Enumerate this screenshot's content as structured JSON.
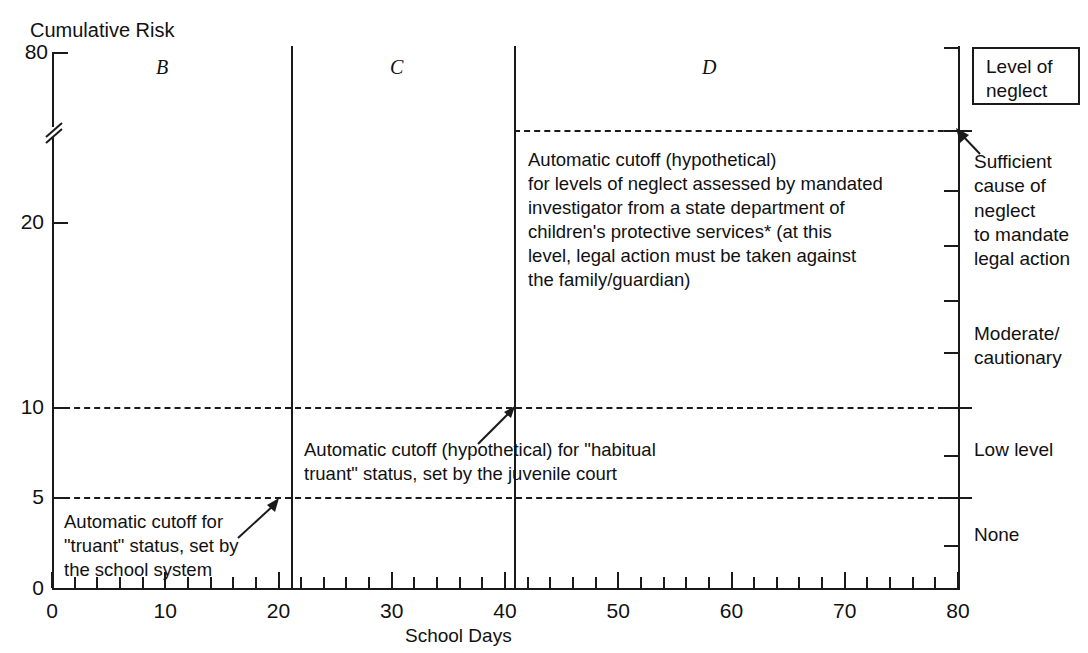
{
  "chart_data": {
    "type": "line",
    "title": "",
    "ylabel": "Cumulative Risk",
    "xlabel": "School Days",
    "xlim": [
      0,
      80
    ],
    "ylim": [
      0,
      80
    ],
    "grid": false,
    "axis_break": true,
    "y_ticks": [
      "0",
      "5",
      "10",
      "20",
      "80"
    ],
    "y_tick_values": [
      0,
      5,
      10,
      20,
      80
    ],
    "x_ticks": [
      "0",
      "10",
      "20",
      "30",
      "40",
      "50",
      "60",
      "70",
      "80"
    ],
    "x_tick_values": [
      0,
      10,
      20,
      30,
      40,
      50,
      60,
      70,
      80
    ],
    "x_minor_tick_step": 2,
    "region_labels": [
      {
        "label": "B",
        "x_center": 10
      },
      {
        "label": "C",
        "x_center": 30
      },
      {
        "label": "D",
        "x_center": 60
      }
    ],
    "vertical_dividers": [
      20,
      40,
      80
    ],
    "cutoff_lines": [
      {
        "name": "mandated-investigator-cutoff",
        "y_value": 40,
        "style": "dashed"
      },
      {
        "name": "habitual-truant-cutoff",
        "y_value": 10,
        "style": "dashed"
      },
      {
        "name": "truant-cutoff",
        "y_value": 5,
        "style": "dashed"
      }
    ],
    "right_axis_label": "Level of neglect",
    "right_axis_categories": [
      "Sufficient cause of neglect to mandate legal action",
      "Moderate/cautionary",
      "Low level",
      "None"
    ]
  },
  "axes": {
    "y_title": "Cumulative Risk",
    "x_title": "School Days",
    "y_labels": [
      "80",
      "20",
      "10",
      "5",
      "0"
    ],
    "x_labels": [
      "0",
      "10",
      "20",
      "30",
      "40",
      "50",
      "60",
      "70",
      "80"
    ]
  },
  "regions": {
    "b": "B",
    "c": "C",
    "d": "D"
  },
  "annotations": {
    "top": "Automatic cutoff (hypothetical)\nfor levels of neglect assessed by mandated\ninvestigator from a state department of\nchildren's protective services* (at this\nlevel, legal action must be taken against\nthe family/guardian)",
    "middle": "Automatic cutoff (hypothetical) for \"habitual\ntruant\" status, set by the juvenile court",
    "bottom": "Automatic cutoff for\n\"truant\" status, set by\nthe school system"
  },
  "legend": {
    "title": "Level of\nneglect",
    "levels": [
      "Sufficient\ncause of\nneglect\nto mandate\nlegal action",
      "Moderate/\ncautionary",
      "Low level",
      "None"
    ]
  },
  "colors": {
    "ink": "#1a1a1a",
    "background": "#ffffff"
  }
}
